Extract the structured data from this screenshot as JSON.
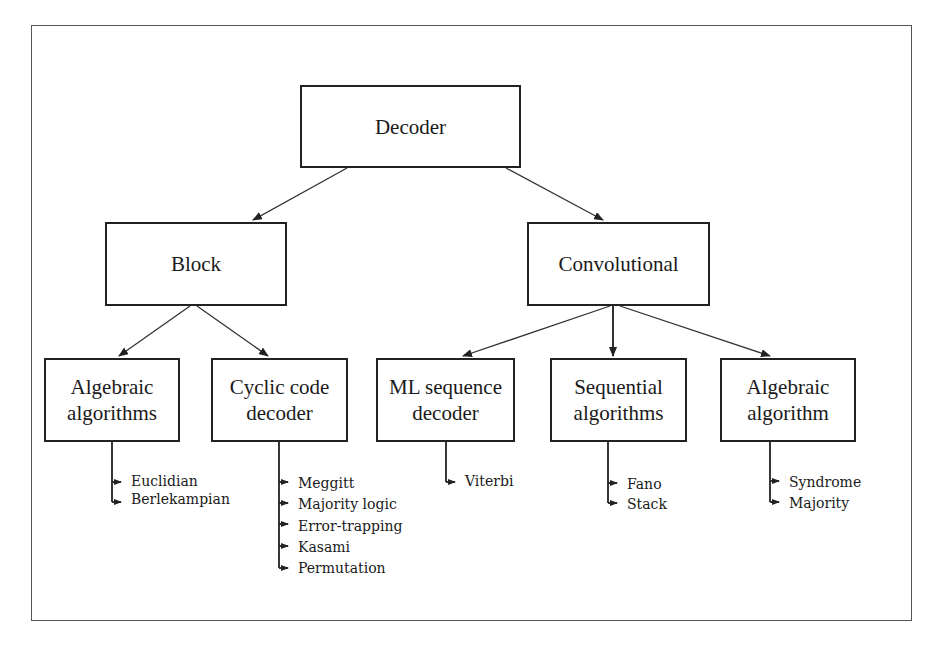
{
  "diagram": {
    "type": "tree",
    "root": {
      "id": "decoder",
      "label": "Decoder"
    },
    "level1": [
      {
        "id": "block",
        "label": "Block"
      },
      {
        "id": "convolutional",
        "label": "Convolutional"
      }
    ],
    "level2": [
      {
        "id": "algebraic-algorithms",
        "label": "Algebraic\nalgorithms",
        "parent": "block",
        "leaves": [
          "Euclidian",
          "Berlekampian"
        ]
      },
      {
        "id": "cyclic-code-decoder",
        "label": "Cyclic code\ndecoder",
        "parent": "block",
        "leaves": [
          "Meggitt",
          "Majority logic",
          "Error-trapping",
          "Kasami",
          "Permutation"
        ]
      },
      {
        "id": "ml-sequence-decoder",
        "label": "ML sequence\ndecoder",
        "parent": "convolutional",
        "leaves": [
          "Viterbi"
        ]
      },
      {
        "id": "sequential-algorithms",
        "label": "Sequential\nalgorithms",
        "parent": "convolutional",
        "leaves": [
          "Fano",
          "Stack"
        ]
      },
      {
        "id": "algebraic-algorithm",
        "label": "Algebraic\nalgorithm",
        "parent": "convolutional",
        "leaves": [
          "Syndrome",
          "Majority"
        ]
      }
    ]
  }
}
